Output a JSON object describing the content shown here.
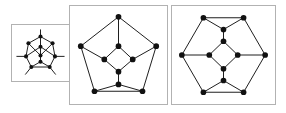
{
  "figure": {
    "width": 286,
    "height": 113,
    "background": "#ffffff",
    "kind": "graph-drawing-sequence",
    "panel_border_color": "#b2b2b2",
    "edge_color": "#1a1a1a",
    "node_color": "#111111",
    "panel_count": 3
  },
  "panels": [
    {
      "id": "panel-1",
      "label": "small graph",
      "order": "1",
      "x": 11,
      "y": 24,
      "w": 59,
      "h": 58,
      "vertex_count": "10",
      "outer_shape": "hexagon",
      "has_edge_stubs": "true",
      "stub_count": "5"
    },
    {
      "id": "panel-2",
      "label": "medium graph",
      "order": "2",
      "x": 69,
      "y": 5,
      "w": 99,
      "h": 100,
      "vertex_count": "10",
      "outer_shape": "pentagon",
      "has_edge_stubs": "false",
      "stub_count": "0"
    },
    {
      "id": "panel-3",
      "label": "large graph",
      "order": "3",
      "x": 171,
      "y": 5,
      "w": 105,
      "h": 100,
      "vertex_count": "12",
      "outer_shape": "hexagon",
      "has_edge_stubs": "false",
      "stub_count": "0"
    }
  ],
  "graph_1": {
    "viewbox": "0 0 59 58",
    "node_radius": 2.1,
    "edge_width": 1.0,
    "nodes": [
      {
        "name": "top",
        "x": 29.5,
        "y": 12.0
      },
      {
        "name": "upper-left",
        "x": 17.0,
        "y": 19.0
      },
      {
        "name": "upper-right",
        "x": 42.0,
        "y": 19.0
      },
      {
        "name": "left",
        "x": 14.5,
        "y": 32.5
      },
      {
        "name": "right",
        "x": 44.5,
        "y": 32.5
      },
      {
        "name": "lower-left",
        "x": 20.0,
        "y": 43.5
      },
      {
        "name": "lower-right",
        "x": 39.0,
        "y": 43.5
      },
      {
        "name": "inner-top",
        "x": 29.5,
        "y": 22.5
      },
      {
        "name": "inner-mid",
        "x": 29.5,
        "y": 31.5
      },
      {
        "name": "inner-low",
        "x": 29.5,
        "y": 38.0
      }
    ],
    "edges": [
      [
        "top",
        "upper-left"
      ],
      [
        "top",
        "upper-right"
      ],
      [
        "upper-left",
        "left"
      ],
      [
        "upper-right",
        "right"
      ],
      [
        "left",
        "lower-left"
      ],
      [
        "right",
        "lower-right"
      ],
      [
        "lower-left",
        "lower-right"
      ],
      [
        "top",
        "inner-top"
      ],
      [
        "inner-top",
        "inner-mid"
      ],
      [
        "inner-mid",
        "inner-low"
      ],
      [
        "inner-low",
        "lower-left"
      ],
      [
        "inner-low",
        "lower-right"
      ],
      [
        "inner-mid",
        "upper-left"
      ],
      [
        "inner-mid",
        "upper-right"
      ],
      [
        "inner-top",
        "left"
      ],
      [
        "inner-top",
        "right"
      ]
    ],
    "stubs": [
      {
        "from": "top",
        "x2": 29.5,
        "y2": 5.0
      },
      {
        "from": "left",
        "x2": 5.0,
        "y2": 32.5
      },
      {
        "from": "right",
        "x2": 54.0,
        "y2": 32.5
      },
      {
        "from": "lower-left",
        "x2": 14.0,
        "y2": 51.0
      },
      {
        "from": "lower-right",
        "x2": 45.0,
        "y2": 51.0
      }
    ]
  },
  "graph_2": {
    "viewbox": "0 0 99 100",
    "node_radius": 2.9,
    "edge_width": 1.0,
    "nodes": [
      {
        "name": "outer-top",
        "x": 49.5,
        "y": 11.0
      },
      {
        "name": "outer-left",
        "x": 11.0,
        "y": 41.0
      },
      {
        "name": "outer-right",
        "x": 88.0,
        "y": 41.0
      },
      {
        "name": "outer-bottom-left",
        "x": 25.0,
        "y": 87.0
      },
      {
        "name": "outer-bottom-right",
        "x": 74.0,
        "y": 87.0
      },
      {
        "name": "inner-top",
        "x": 49.5,
        "y": 41.0
      },
      {
        "name": "inner-left",
        "x": 35.0,
        "y": 54.5
      },
      {
        "name": "inner-right",
        "x": 64.0,
        "y": 54.5
      },
      {
        "name": "inner-bottom",
        "x": 49.5,
        "y": 67.0
      },
      {
        "name": "hub-bottom",
        "x": 49.5,
        "y": 80.0
      }
    ],
    "edges": [
      [
        "outer-top",
        "outer-left"
      ],
      [
        "outer-top",
        "outer-right"
      ],
      [
        "outer-left",
        "outer-bottom-left"
      ],
      [
        "outer-right",
        "outer-bottom-right"
      ],
      [
        "outer-bottom-left",
        "outer-bottom-right"
      ],
      [
        "outer-top",
        "inner-top"
      ],
      [
        "inner-top",
        "inner-left"
      ],
      [
        "inner-top",
        "inner-right"
      ],
      [
        "inner-left",
        "inner-bottom"
      ],
      [
        "inner-right",
        "inner-bottom"
      ],
      [
        "inner-bottom",
        "hub-bottom"
      ],
      [
        "hub-bottom",
        "outer-bottom-left"
      ],
      [
        "hub-bottom",
        "outer-bottom-right"
      ],
      [
        "inner-left",
        "outer-left"
      ],
      [
        "inner-right",
        "outer-right"
      ]
    ]
  },
  "graph_3": {
    "viewbox": "0 0 105 100",
    "node_radius": 2.9,
    "edge_width": 1.0,
    "nodes": [
      {
        "name": "outer-top-left",
        "x": 32.0,
        "y": 12.0
      },
      {
        "name": "outer-top-right",
        "x": 73.0,
        "y": 12.0
      },
      {
        "name": "outer-left",
        "x": 10.0,
        "y": 50.0
      },
      {
        "name": "outer-right",
        "x": 95.0,
        "y": 50.0
      },
      {
        "name": "outer-bottom-left",
        "x": 32.0,
        "y": 88.0
      },
      {
        "name": "outer-bottom-right",
        "x": 73.0,
        "y": 88.0
      },
      {
        "name": "hub-top",
        "x": 52.5,
        "y": 24.0
      },
      {
        "name": "inner-top",
        "x": 52.5,
        "y": 36.0
      },
      {
        "name": "inner-left",
        "x": 38.0,
        "y": 50.0
      },
      {
        "name": "inner-right",
        "x": 67.0,
        "y": 50.0
      },
      {
        "name": "inner-bottom",
        "x": 52.5,
        "y": 64.0
      },
      {
        "name": "hub-bottom",
        "x": 52.5,
        "y": 76.0
      }
    ],
    "edges": [
      [
        "outer-top-left",
        "outer-top-right"
      ],
      [
        "outer-top-left",
        "outer-left"
      ],
      [
        "outer-top-right",
        "outer-right"
      ],
      [
        "outer-left",
        "outer-bottom-left"
      ],
      [
        "outer-right",
        "outer-bottom-right"
      ],
      [
        "outer-bottom-left",
        "outer-bottom-right"
      ],
      [
        "outer-top-left",
        "hub-top"
      ],
      [
        "outer-top-right",
        "hub-top"
      ],
      [
        "hub-top",
        "inner-top"
      ],
      [
        "inner-top",
        "inner-left"
      ],
      [
        "inner-top",
        "inner-right"
      ],
      [
        "inner-left",
        "inner-bottom"
      ],
      [
        "inner-right",
        "inner-bottom"
      ],
      [
        "inner-bottom",
        "hub-bottom"
      ],
      [
        "hub-bottom",
        "outer-bottom-left"
      ],
      [
        "hub-bottom",
        "outer-bottom-right"
      ],
      [
        "inner-left",
        "outer-left"
      ],
      [
        "inner-right",
        "outer-right"
      ]
    ]
  }
}
